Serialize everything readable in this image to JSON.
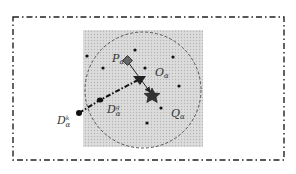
{
  "diagram": {
    "outer_border": {
      "style": "dash-dot",
      "color": "#222222"
    },
    "region": {
      "fill": "#d6d6d6",
      "pattern": "dotted"
    },
    "circle": {
      "style": "dashed",
      "color": "#555555"
    },
    "labels": {
      "p": {
        "main": "P",
        "sub": "α"
      },
      "o": {
        "main": "O",
        "sub": "α"
      },
      "q": {
        "main": "Q",
        "sub": "α"
      },
      "dg": {
        "main": "D",
        "sub": "α",
        "sup": "g"
      },
      "dk": {
        "main": "D",
        "sub": "α",
        "sup": "k"
      }
    },
    "markers": {
      "p": "diamond",
      "o": "triangle",
      "target": "star",
      "dg": "dot",
      "dk": "dot"
    }
  }
}
